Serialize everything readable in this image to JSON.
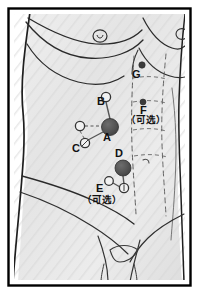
{
  "figure": {
    "frame_color": "#000000",
    "background_color": "#ffffff",
    "body_fill": "#e9e9e9",
    "outline_color": "#1a1a1a",
    "primary_port_color": "#4f4f4f",
    "secondary_port_fill": "#f2f2f2",
    "secondary_port_stroke": "#333333",
    "dot_port_color": "#3a3a3a",
    "connector_color": "#555555"
  },
  "ports": [
    {
      "id": "A",
      "label": "A",
      "type": "primary",
      "optional": false,
      "cx": 110,
      "cy": 127,
      "r": 8.5
    },
    {
      "id": "B",
      "label": "B",
      "type": "secondary",
      "optional": false,
      "cx": 106,
      "cy": 97,
      "r": 4.6
    },
    {
      "id": "C",
      "label": "C",
      "type": "secondary",
      "optional": false,
      "cx": 80,
      "cy": 126,
      "r": 4.6
    },
    {
      "id": "C2",
      "label": "",
      "type": "secondary",
      "optional": false,
      "cx": 85,
      "cy": 143,
      "r": 4.6
    },
    {
      "id": "D",
      "label": "D",
      "type": "primary",
      "optional": false,
      "cx": 123,
      "cy": 168,
      "r": 8.0
    },
    {
      "id": "E",
      "label": "E",
      "type": "secondary",
      "optional": true,
      "cx": 109,
      "cy": 181,
      "r": 4.3
    },
    {
      "id": "E2",
      "label": "",
      "type": "secondary",
      "optional": true,
      "cx": 124,
      "cy": 188,
      "r": 4.6
    },
    {
      "id": "F",
      "label": "F",
      "type": "dot",
      "optional": true,
      "cx": 143,
      "cy": 102,
      "r": 3.0
    },
    {
      "id": "G",
      "label": "G",
      "type": "dot",
      "optional": false,
      "cx": 142,
      "cy": 65,
      "r": 3.2
    }
  ],
  "labels": [
    {
      "key": "A",
      "text": "A",
      "x": 103,
      "y": 138,
      "kind": "letter"
    },
    {
      "key": "B",
      "text": "B",
      "x": 98,
      "y": 101,
      "kind": "letter"
    },
    {
      "key": "C",
      "text": "C",
      "x": 73,
      "y": 148,
      "kind": "letter"
    },
    {
      "key": "D",
      "text": "D",
      "x": 116,
      "y": 153,
      "kind": "letter"
    },
    {
      "key": "E",
      "text": "E",
      "x": 97,
      "y": 188,
      "kind": "letter"
    },
    {
      "key": "F",
      "text": "F",
      "x": 140,
      "y": 110,
      "kind": "letter"
    },
    {
      "key": "G",
      "text": "G",
      "x": 133,
      "y": 74,
      "kind": "letter"
    }
  ],
  "optional_notes": [
    {
      "key": "F-optional",
      "text": "（可选）",
      "x": 128,
      "y": 119
    },
    {
      "key": "E-optional",
      "text": "（可选）",
      "x": 84,
      "y": 199
    }
  ],
  "connectors": [
    {
      "from": "B",
      "to": "A",
      "style": "solid"
    },
    {
      "from": "C",
      "to": "A",
      "style": "dashed"
    },
    {
      "from": "C2",
      "to": "A",
      "style": "solid"
    },
    {
      "from": "C",
      "to": "C2",
      "style": "dashed"
    },
    {
      "from": "D",
      "to": "E2",
      "style": "solid"
    },
    {
      "from": "E",
      "to": "E2",
      "style": "solid"
    }
  ]
}
